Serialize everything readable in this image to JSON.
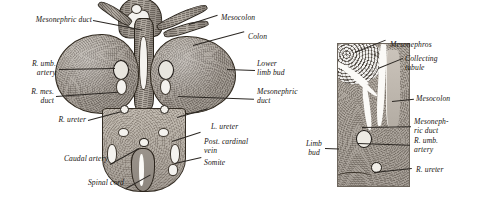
{
  "plate": {
    "title": "Transverse section of embryo showing mesonephros and limb buds",
    "ink_color": "#191512",
    "background": "#ffffff",
    "tissue_color": "#a7a098"
  },
  "left_figure": {
    "name": "transverse-section-overview",
    "labels": [
      {
        "id": "mesonephric-duct-left",
        "text": "Mesonephric duct",
        "align": "left"
      },
      {
        "id": "r-umb-artery",
        "text": "R. umb.\nartery",
        "align": "right"
      },
      {
        "id": "r-mes-duct",
        "text": "R. mes.\nduct",
        "align": "right"
      },
      {
        "id": "r-ureter",
        "text": "R. ureter",
        "align": "right"
      },
      {
        "id": "caudal-artery",
        "text": "Caudal artery",
        "align": "right"
      },
      {
        "id": "spinal-cord",
        "text": "Spinal cord",
        "align": "right"
      },
      {
        "id": "mesocolon",
        "text": "Mesocolon",
        "align": "left"
      },
      {
        "id": "colon",
        "text": "Colon",
        "align": "left"
      },
      {
        "id": "lower-limb-bud",
        "text": "Lower\nlimb bud",
        "align": "left"
      },
      {
        "id": "mesonephric-duct-right",
        "text": "Mesonephric\nduct",
        "align": "left"
      },
      {
        "id": "l-ureter",
        "text": "L. ureter",
        "align": "left"
      },
      {
        "id": "post-cardinal-vein",
        "text": "Post. cardinal\nvein",
        "align": "left"
      },
      {
        "id": "somite",
        "text": "Somite",
        "align": "left"
      }
    ]
  },
  "right_figure": {
    "name": "mesonephros-detail",
    "labels": [
      {
        "id": "mesonephros",
        "text": "Mesonephros",
        "align": "left"
      },
      {
        "id": "collecting-tubule",
        "text": "Collecting\ntubule",
        "align": "left"
      },
      {
        "id": "mesocolon-detail",
        "text": "Mesocolon",
        "align": "left"
      },
      {
        "id": "mesonephric-duct-detail",
        "text": "Mesoneph-\nric duct",
        "align": "left"
      },
      {
        "id": "r-umb-artery-detail",
        "text": "R. umb.\nartery",
        "align": "left"
      },
      {
        "id": "r-ureter-detail",
        "text": "R. ureter",
        "align": "left"
      },
      {
        "id": "limb-bud",
        "text": "Limb\nbud",
        "align": "right"
      }
    ]
  }
}
